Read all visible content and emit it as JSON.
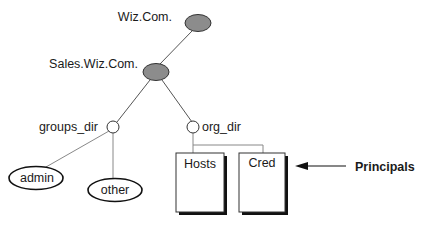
{
  "diagram": {
    "type": "namespace-tree",
    "nodes": {
      "root": {
        "label": "Wiz.Com.",
        "shape": "filled-ellipse",
        "fill": "#8c8c8c"
      },
      "sales": {
        "label": "Sales.Wiz.Com.",
        "shape": "filled-ellipse",
        "fill": "#8c8c8c"
      },
      "groups_dir": {
        "label": "groups_dir",
        "shape": "open-circle"
      },
      "org_dir": {
        "label": "org_dir",
        "shape": "open-circle"
      },
      "admin": {
        "label": "admin",
        "shape": "ellipse"
      },
      "other": {
        "label": "other",
        "shape": "ellipse"
      },
      "hosts": {
        "label": "Hosts",
        "shape": "table-box"
      },
      "cred": {
        "label": "Cred",
        "shape": "table-box"
      }
    },
    "edges": [
      [
        "root",
        "sales"
      ],
      [
        "sales",
        "groups_dir"
      ],
      [
        "sales",
        "org_dir"
      ],
      [
        "groups_dir",
        "admin"
      ],
      [
        "groups_dir",
        "other"
      ],
      [
        "org_dir",
        "hosts"
      ],
      [
        "org_dir",
        "cred"
      ]
    ],
    "annotation": {
      "label": "Principals",
      "points_to": "cred"
    }
  }
}
